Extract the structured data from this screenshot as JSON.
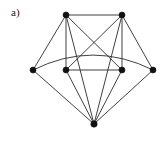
{
  "figure": {
    "label": "a)",
    "width": 166,
    "height": 145,
    "background_color": "#ffffff",
    "edge_color": "#2b2b2b",
    "vertex_color": "#111111",
    "label_color": "#1a1a1a"
  },
  "chart_data": {
    "type": "diagram",
    "diagram_type": "undirected-graph",
    "title": "a)",
    "xlabel": "",
    "ylabel": "",
    "vertex_count": 7,
    "edge_count": 14,
    "vertices": [
      {
        "id": "v1",
        "label": "top-left",
        "x": 66,
        "y": 15,
        "r": 3.0
      },
      {
        "id": "v2",
        "label": "top-right",
        "x": 122,
        "y": 15,
        "r": 3.0
      },
      {
        "id": "v3",
        "label": "mid-far-left",
        "x": 33,
        "y": 70,
        "r": 3.0
      },
      {
        "id": "v4",
        "label": "mid-left",
        "x": 66,
        "y": 70,
        "r": 3.0
      },
      {
        "id": "v5",
        "label": "mid-right",
        "x": 122,
        "y": 70,
        "r": 3.0
      },
      {
        "id": "v6",
        "label": "mid-far-right",
        "x": 153,
        "y": 70,
        "r": 3.0
      },
      {
        "id": "v7",
        "label": "bottom",
        "x": 94,
        "y": 124,
        "r": 3.2
      }
    ],
    "edges": [
      {
        "id": "e1",
        "from": "v1",
        "to": "v2",
        "curved": false
      },
      {
        "id": "e2",
        "from": "v1",
        "to": "v3",
        "curved": false
      },
      {
        "id": "e3",
        "from": "v1",
        "to": "v4",
        "curved": false
      },
      {
        "id": "e4",
        "from": "v1",
        "to": "v5",
        "curved": false
      },
      {
        "id": "e5",
        "from": "v1",
        "to": "v7",
        "curved": false
      },
      {
        "id": "e6",
        "from": "v2",
        "to": "v4",
        "curved": false
      },
      {
        "id": "e7",
        "from": "v2",
        "to": "v5",
        "curved": false
      },
      {
        "id": "e8",
        "from": "v2",
        "to": "v6",
        "curved": false
      },
      {
        "id": "e9",
        "from": "v2",
        "to": "v7",
        "curved": false
      },
      {
        "id": "e10",
        "from": "v3",
        "to": "v6",
        "curved": true,
        "arc_apex_y": 55
      },
      {
        "id": "e11",
        "from": "v3",
        "to": "v7",
        "curved": false
      },
      {
        "id": "e12",
        "from": "v4",
        "to": "v5",
        "curved": false
      },
      {
        "id": "e13",
        "from": "v4",
        "to": "v7",
        "curved": false
      },
      {
        "id": "e14",
        "from": "v5",
        "to": "v7",
        "curved": false
      },
      {
        "id": "e15",
        "from": "v6",
        "to": "v7",
        "curved": false
      }
    ]
  }
}
